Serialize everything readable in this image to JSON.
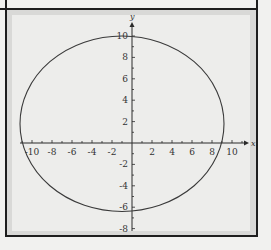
{
  "chart_data": {
    "type": "line",
    "title": "",
    "xlabel": "x",
    "ylabel": "y",
    "xlim": [
      -11,
      11
    ],
    "ylim": [
      -8.5,
      11
    ],
    "grid": false,
    "x_ticks": [
      -10,
      -8,
      -6,
      -4,
      -2,
      2,
      4,
      6,
      8,
      10
    ],
    "y_ticks": [
      10,
      8,
      6,
      4,
      2,
      -2,
      -4,
      -6,
      -8
    ],
    "series": [
      {
        "name": "ellipse",
        "shape": "ellipse",
        "center": [
          -1,
          1.8
        ],
        "radius_x": 10.2,
        "radius_y": 8.2,
        "key_points": {
          "top": [
            -1,
            10
          ],
          "bottom": [
            -1,
            -6.4
          ],
          "left": [
            -11.2,
            1.8
          ],
          "right": [
            9.3,
            1.8
          ]
        }
      }
    ]
  },
  "axes": {
    "x_label": "x",
    "y_label": "y",
    "x_tick_labels": [
      "-10",
      "-8",
      "-6",
      "-4",
      "-2",
      "2",
      "4",
      "6",
      "8",
      "10"
    ],
    "y_tick_labels": [
      "10",
      "8",
      "6",
      "4",
      "2",
      "-2",
      "-4",
      "-6",
      "-8"
    ]
  }
}
